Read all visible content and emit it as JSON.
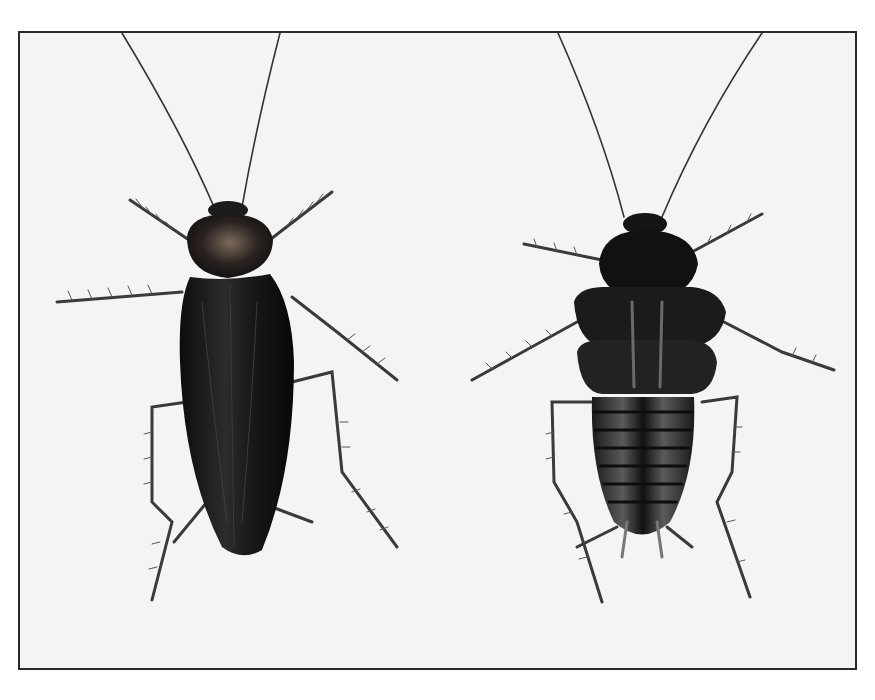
{
  "image": {
    "subject": "two cockroach specimens, dorsal view",
    "specimens": [
      {
        "position": "left",
        "description": "winged adult"
      },
      {
        "position": "right",
        "description": "wingless nymph/female"
      }
    ]
  },
  "colors": {
    "background": "#f4f4f4",
    "frame": "#2a2a2a",
    "body": "#141414",
    "highlight": "#6a6a6a",
    "leg": "#3a3a3a"
  }
}
